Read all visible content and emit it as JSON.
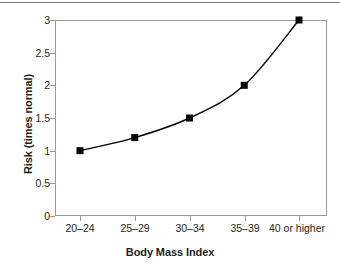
{
  "chart_data": {
    "type": "line",
    "title": "",
    "xlabel": "Body Mass Index",
    "ylabel": "Risk (times normal)",
    "categories": [
      "20–24",
      "25–29",
      "30–34",
      "35–39",
      "40 or higher"
    ],
    "values": [
      1,
      1.2,
      1.5,
      2,
      3
    ],
    "series": [
      {
        "name": "Risk",
        "values": [
          1,
          1.2,
          1.5,
          2,
          3
        ]
      }
    ],
    "ylim": [
      0,
      3
    ],
    "yticks": [
      0,
      0.5,
      1,
      1.5,
      2,
      2.5,
      3
    ],
    "ytick_labels": [
      "0",
      "0.5",
      "1",
      "1.5",
      "2",
      "2.5",
      "3"
    ],
    "grid": false,
    "legend": false,
    "marker": "square",
    "marker_color": "#000000",
    "line_color": "#000000",
    "frame_color": "#9a9a9a",
    "background": "#ffffff"
  },
  "figure": {
    "page_rule_color": "#5d5f63"
  }
}
